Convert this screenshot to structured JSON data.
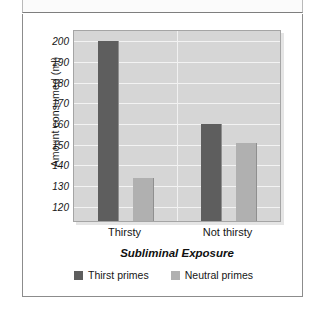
{
  "figure": {
    "header_band_label": "",
    "accent_dark": "#5e5e5e",
    "accent_light": "#b0b0b0",
    "panel_background": "#d6d6d6",
    "gridline_color": "#f3f3f3"
  },
  "chart_data": {
    "type": "bar",
    "title": "",
    "subtitle": "",
    "xlabel": "Subliminal Exposure",
    "ylabel": "Amount consumed (ml)",
    "categories": [
      "Thirsty",
      "Not thirsty"
    ],
    "series": [
      {
        "name": "Thirst primes",
        "color": "#5e5e5e",
        "values": [
          200,
          160
        ]
      },
      {
        "name": "Neutral primes",
        "color": "#b0b0b0",
        "values": [
          134,
          151
        ]
      }
    ],
    "ylim": [
      113,
      205
    ],
    "yticks": [
      120,
      130,
      140,
      150,
      160,
      170,
      180,
      190,
      200
    ],
    "ytick_labels": [
      "120",
      "130",
      "140",
      "150",
      "160",
      "170",
      "180",
      "190",
      "200"
    ],
    "grid": true,
    "grid_axis": "y",
    "legend_position": "bottom-center",
    "legend_entries": [
      "Thirst primes",
      "Neutral primes"
    ],
    "annotations": []
  }
}
